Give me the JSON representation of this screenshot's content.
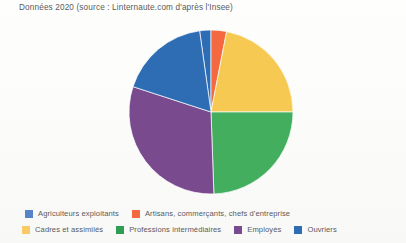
{
  "chart_data": {
    "type": "pie",
    "title": "Données 2020 (source : Linternaute.com d'après l'Insee)",
    "xlabel": "",
    "ylabel": "",
    "legend_position": "bottom",
    "grid": false,
    "categories": [
      "Agriculteurs exploitants",
      "Artisans, commerçants, chefs d'entreprise",
      "Cadres et assimilés",
      "Professions intermédiaires",
      "Employés",
      "Ouvriers"
    ],
    "values": [
      2,
      3,
      22,
      25,
      29,
      19
    ],
    "colors": [
      "#2E6DB4",
      "#F4693F",
      "#F6C953",
      "#43AE5E",
      "#7A4A8E",
      "#2E6DB4"
    ],
    "slices": [
      {
        "label": "Agriculteurs exploitants",
        "value": 2,
        "color": "#2E6DB4",
        "start_angle": 352,
        "end_angle": 360
      },
      {
        "label": "Artisans, commerçants, chefs d'entreprise",
        "value": 3,
        "color": "#F4693F",
        "start_angle": 0,
        "end_angle": 11
      },
      {
        "label": "Cadres et assimilés",
        "value": 22,
        "color": "#F6C953",
        "start_angle": 11,
        "end_angle": 90
      },
      {
        "label": "Professions intermédiaires",
        "value": 25,
        "color": "#43AE5E",
        "start_angle": 90,
        "end_angle": 178
      },
      {
        "label": "Employés",
        "value": 29,
        "color": "#7A4A8E",
        "start_angle": 178,
        "end_angle": 288
      },
      {
        "label": "Ouvriers",
        "value": 19,
        "color": "#2E6DB4",
        "start_angle": 288,
        "end_angle": 352
      }
    ]
  },
  "title": {
    "text": "Données 2020 (source : Linternaute.com d'après l'Insee)"
  },
  "legend": {
    "row1": [
      {
        "label": "Agriculteurs exploitants",
        "color": "#5585C8"
      },
      {
        "label": "Artisans, commerçants, chefs d'entreprise",
        "color": "#F4693F"
      }
    ],
    "row2": [
      {
        "label": "Cadres et assimilés",
        "color": "#F8C967"
      },
      {
        "label": "Professions intermédiaires",
        "color": "#2E9E55"
      },
      {
        "label": "Employés",
        "color": "#7A4A8E"
      },
      {
        "label": "Ouvriers",
        "color": "#2E6DB4"
      }
    ]
  }
}
